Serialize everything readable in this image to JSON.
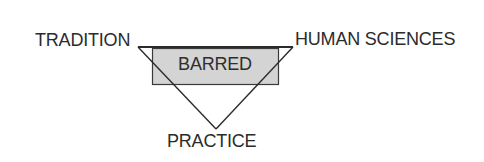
{
  "diagram": {
    "type": "triangle-with-overlay-box",
    "vertices": {
      "top_left": {
        "label": "TRADITION"
      },
      "top_right": {
        "label": "HUMAN SCIENCES"
      },
      "bottom": {
        "label": "PRACTICE"
      }
    },
    "overlay_box": {
      "label": "BARRED",
      "fill_color": "#d4d4d4"
    },
    "colors": {
      "stroke": "#2b2b2b",
      "text": "#2b2b2b",
      "background": "#ffffff"
    }
  }
}
